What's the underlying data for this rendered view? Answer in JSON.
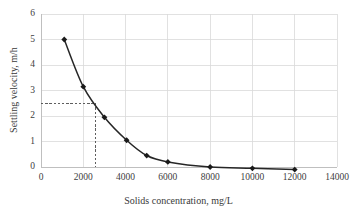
{
  "chart_data": {
    "type": "line",
    "title": "",
    "xlabel": "Solids concentration, mg/L",
    "ylabel": "Settling velocity, m/h",
    "xlim": [
      0,
      14000
    ],
    "ylim": [
      0,
      6
    ],
    "xticks": [
      0,
      2000,
      4000,
      6000,
      8000,
      10000,
      12000,
      14000
    ],
    "xtick_labels": [
      "0",
      "2000",
      "4000",
      "6000",
      "8000",
      "10000",
      "12000",
      "14000"
    ],
    "yticks": [
      0,
      1,
      2,
      3,
      4,
      5,
      6
    ],
    "ytick_labels": [
      "0",
      "1",
      "2",
      "3",
      "4",
      "5",
      "6"
    ],
    "grid": true,
    "grid_axis": "both",
    "legend": false,
    "marker": "diamond",
    "line_color": "#262626",
    "marker_color": "#1a1a1a",
    "grid_color": "#d9d9d9",
    "axis_color": "#bfbfbf",
    "series": [
      {
        "name": "Settling velocity",
        "x": [
          1100,
          2000,
          3000,
          4050,
          5000,
          6000,
          8000,
          10000,
          12000
        ],
        "values": [
          5.0,
          3.15,
          1.95,
          1.05,
          0.45,
          0.2,
          0.0,
          -0.05,
          -0.1
        ]
      }
    ],
    "annotations": [
      {
        "name": "design-point-guide",
        "type": "dashed-crosshair",
        "x": 2600,
        "y": 2.5,
        "color": "#4d4d4d",
        "style": "dashed"
      }
    ]
  },
  "axes": {
    "x_title": "Solids concentration, mg/L",
    "y_title": "Settling velocity, m/h"
  }
}
